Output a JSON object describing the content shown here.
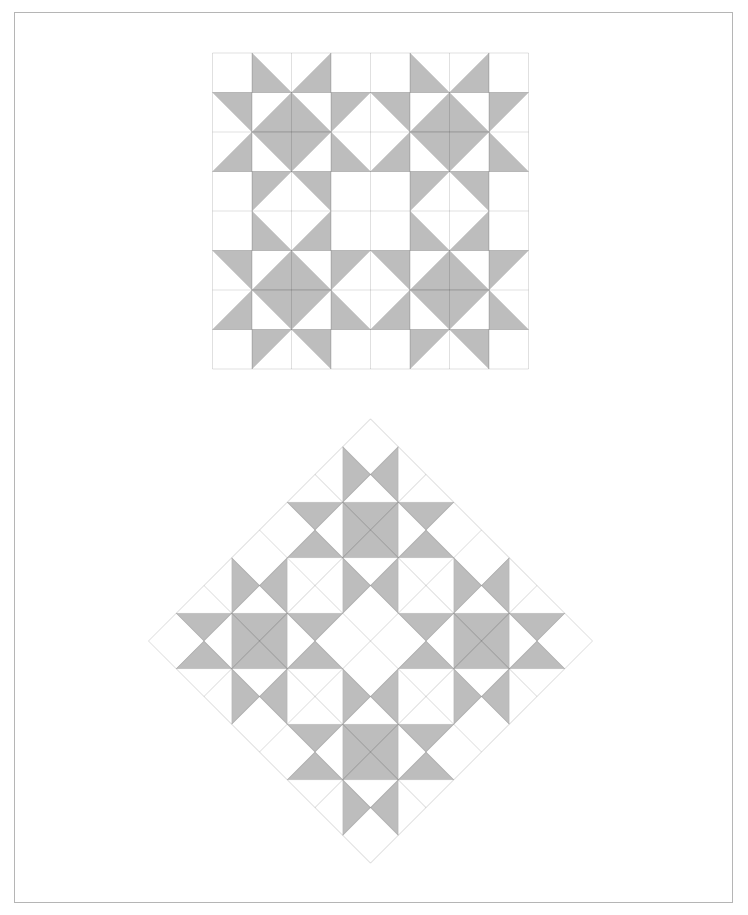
{
  "page": {
    "background_color": "#ffffff",
    "frame": {
      "x": 14,
      "y": 12,
      "width": 717,
      "height": 889,
      "border_color": "#b5b5b5"
    }
  },
  "quilt": {
    "description": "star-quilt-block-pattern",
    "grid_size": 8,
    "cell_codes": [
      [
        "",
        "SW",
        "SE",
        "",
        "",
        "SW",
        "SE",
        ""
      ],
      [
        "NE",
        "SE",
        "SW",
        "NW",
        "NE",
        "SE",
        "SW",
        "NW"
      ],
      [
        "SE",
        "NE",
        "NW",
        "SW",
        "SE",
        "NE",
        "NW",
        "SW"
      ],
      [
        "",
        "NW",
        "NE",
        "",
        "",
        "NW",
        "NE",
        ""
      ],
      [
        "",
        "SW",
        "SE",
        "",
        "",
        "SW",
        "SE",
        ""
      ],
      [
        "NE",
        "SE",
        "SW",
        "NW",
        "NE",
        "SE",
        "SW",
        "NW"
      ],
      [
        "SE",
        "NE",
        "NW",
        "SW",
        "SE",
        "NE",
        "NW",
        "SW"
      ],
      [
        "",
        "NW",
        "NE",
        "",
        "",
        "NW",
        "NE",
        ""
      ]
    ],
    "colors": {
      "patch_fill": "#bdbdbd",
      "patch_edge": "rgba(0,0,0,0.07)",
      "grid_line": "rgba(0,0,0,0.12)",
      "cell_background": "#ffffff"
    }
  },
  "instances": [
    {
      "name": "quilt-straight",
      "cx": 370.5,
      "cy": 211,
      "size": 316,
      "rotation": 0
    },
    {
      "name": "quilt-on-point",
      "cx": 370.5,
      "cy": 641,
      "size": 314,
      "rotation": 45
    }
  ]
}
